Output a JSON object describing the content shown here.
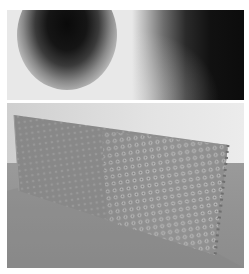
{
  "figure": {
    "panels": [
      {
        "id": "top",
        "description": "Blurred grayscale pattern: dark circular blob on left, dark gradient region on right",
        "colors": {
          "background": "#e8e8e8",
          "dark": "#0c0c0c"
        }
      },
      {
        "id": "bottom",
        "description": "Photograph of a perforated lattice panel standing on a gray surface",
        "colors": {
          "wall": "#e3e3e3",
          "floor": "#929292",
          "lattice": "#8a8a8a",
          "lattice_highlight": "#c4c4c4"
        }
      }
    ]
  }
}
